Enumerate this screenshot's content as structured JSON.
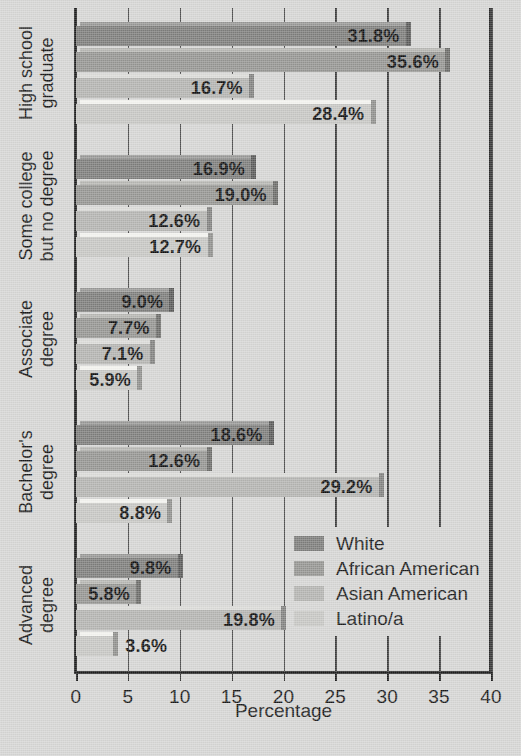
{
  "chart_data": {
    "type": "bar",
    "orientation": "horizontal",
    "title": "",
    "xlabel": "Percentage",
    "ylabel": "",
    "xlim": [
      0,
      40
    ],
    "xticks": [
      0,
      5,
      10,
      15,
      20,
      25,
      30,
      35,
      40
    ],
    "grid": true,
    "legend_position": "bottom-right",
    "categories": [
      "High school graduate",
      "Some college but no degree",
      "Associate degree",
      "Bachelor's degree",
      "Advanced degree"
    ],
    "category_lines": [
      [
        "High school",
        "graduate"
      ],
      [
        "Some college",
        "but no degree"
      ],
      [
        "Associate",
        "degree"
      ],
      [
        "Bachelor's",
        "degree"
      ],
      [
        "Advanced",
        "degree"
      ]
    ],
    "series": [
      {
        "name": "White",
        "color": "#7c7c7a",
        "values": [
          31.8,
          16.9,
          9.0,
          18.6,
          9.8
        ],
        "labels": [
          "31.8%",
          "16.9%",
          "9.0%",
          "18.6%",
          "9.8%"
        ]
      },
      {
        "name": "African American",
        "color": "#949491",
        "values": [
          35.6,
          19.0,
          7.7,
          12.6,
          5.8
        ],
        "labels": [
          "35.6%",
          "19.0%",
          "7.7%",
          "12.6%",
          "5.8%"
        ]
      },
      {
        "name": "Asian American",
        "color": "#b3b3b0",
        "values": [
          16.7,
          12.6,
          7.1,
          29.2,
          19.8
        ],
        "labels": [
          "16.7%",
          "12.6%",
          "7.1%",
          "29.2%",
          "19.8%"
        ]
      },
      {
        "name": "Latino/a",
        "color": "#c6c6c3",
        "values": [
          28.4,
          12.7,
          5.9,
          8.8,
          3.6
        ],
        "labels": [
          "28.4%",
          "12.7%",
          "5.9%",
          "8.8%",
          "3.6%"
        ]
      }
    ]
  }
}
